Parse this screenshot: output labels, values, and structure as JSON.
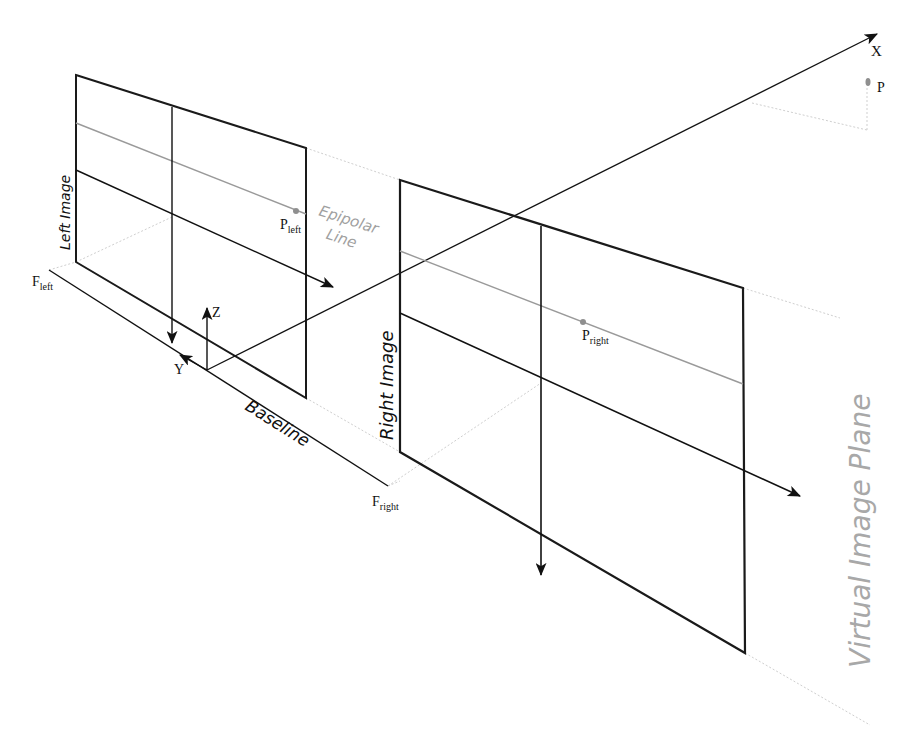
{
  "diagram": {
    "colors": {
      "frame": "#1a1a1a",
      "axis": "#111111",
      "epipolar": "#9a9a9a",
      "guide": "#c8c8c8",
      "point": "#8f8f8f",
      "virtual_plane_label": "#a8a8a8"
    },
    "labels": {
      "x_axis": "X",
      "y_axis": "Y",
      "z_axis": "Z",
      "point_p": "P",
      "p_left_main": "P",
      "p_left_sub": "left",
      "p_right_main": "P",
      "p_right_sub": "right",
      "f_left_main": "F",
      "f_left_sub": "left",
      "f_right_main": "F",
      "f_right_sub": "right",
      "left_image": "Left Image",
      "right_image": "Right Image",
      "epipolar_line_1": "Epipolar",
      "epipolar_line_2": "Line",
      "baseline": "Baseline",
      "virtual_image_plane": "Virtual Image Plane"
    },
    "nodes": [
      {
        "id": "F_left",
        "label": "F_left",
        "x": 49,
        "y": 270
      },
      {
        "id": "F_right",
        "label": "F_right",
        "x": 388,
        "y": 486
      },
      {
        "id": "origin",
        "label": "origin",
        "x": 207,
        "y": 370
      },
      {
        "id": "P",
        "label": "P",
        "x": 868,
        "y": 82
      },
      {
        "id": "P_left",
        "label": "P_left",
        "x": 296,
        "y": 211
      },
      {
        "id": "P_right",
        "label": "P_right",
        "x": 583,
        "y": 322
      }
    ],
    "edges": [
      {
        "from": "F_left",
        "to": "F_right",
        "label": "Baseline"
      },
      {
        "from": "origin",
        "to": "X",
        "label": "X axis"
      },
      {
        "from": "origin",
        "to": "Z",
        "label": "Z axis"
      },
      {
        "from": "origin",
        "to": "Y",
        "label": "Y axis"
      },
      {
        "from": "P_left",
        "to": "P_right",
        "label": "Epipolar Line"
      }
    ]
  }
}
